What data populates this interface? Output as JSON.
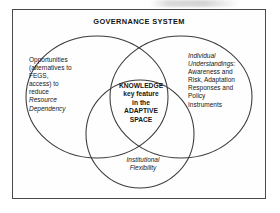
{
  "figure": {
    "type": "venn-diagram",
    "title": "GOVERNANCE SYSTEM",
    "frame_label": "GOVERNANCE SYSTEM",
    "colors": {
      "stroke": "#3b3b3b",
      "frame": "#4a4a4a",
      "background": "#ffffff",
      "text": "#161616"
    },
    "sets": [
      {
        "id": "opportunities",
        "position": "left",
        "lines": [
          {
            "text": "Opportunities",
            "style": "normal"
          },
          {
            "text": "(alternatives to",
            "style": "normal"
          },
          {
            "text": "FEGS,",
            "style": "normal"
          },
          {
            "text": "access) to",
            "style": "normal"
          },
          {
            "text": "reduce",
            "style": "normal"
          },
          {
            "text": "Resource",
            "style": "italic"
          },
          {
            "text": "Dependency",
            "style": "italic"
          }
        ],
        "plain_text": "Opportunities (alternatives to FEGS, access) to reduce Resource Dependency"
      },
      {
        "id": "individual-understandings",
        "position": "right",
        "lines": [
          {
            "text": "Individual",
            "style": "italic"
          },
          {
            "text": "Understandings:",
            "style": "italic"
          },
          {
            "text": "Awareness and",
            "style": "normal"
          },
          {
            "text": "Risk, Adaptation",
            "style": "normal"
          },
          {
            "text": "Responses and",
            "style": "normal"
          },
          {
            "text": "Policy",
            "style": "normal"
          },
          {
            "text": "Instruments",
            "style": "normal"
          }
        ],
        "plain_text": "Individual Understandings: Awareness and Risk, Adaptation Responses and Policy Instruments"
      },
      {
        "id": "institutional-flexibility",
        "position": "bottom",
        "lines": [
          {
            "text": "Institutional",
            "style": "italic"
          },
          {
            "text": "Flexibility",
            "style": "italic"
          }
        ],
        "plain_text": "Institutional Flexibility"
      }
    ],
    "intersection": {
      "id": "knowledge-adaptive-space",
      "lines": [
        {
          "text": "KNOWLEDGE",
          "style": "bold"
        },
        {
          "text": "key feature",
          "style": "bold"
        },
        {
          "text": "in the",
          "style": "bold"
        },
        {
          "text": "ADAPTIVE",
          "style": "bold"
        },
        {
          "text": "SPACE",
          "style": "bold"
        }
      ],
      "plain_text": "KNOWLEDGE key feature in the ADAPTIVE SPACE"
    }
  }
}
